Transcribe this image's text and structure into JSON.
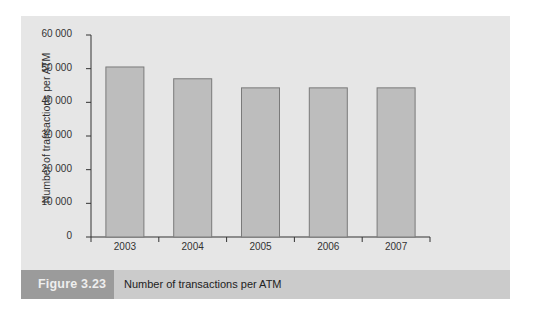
{
  "chart_data": {
    "type": "bar",
    "title": "Number of transactions per ATM",
    "figure_label": "Figure 3.23",
    "xlabel": "",
    "ylabel": "Number of transactions per ATM",
    "categories": [
      "2003",
      "2004",
      "2005",
      "2006",
      "2007"
    ],
    "values": [
      50500,
      47000,
      44300,
      44300,
      44300
    ],
    "ylim": [
      0,
      60000
    ],
    "yticks": [
      "0",
      "10 000",
      "20 000",
      "30 000",
      "40 000",
      "50 000",
      "60 000"
    ],
    "grid": false,
    "legend": null,
    "colors": {
      "bar_fill": "#bdbdbd",
      "bar_stroke": "#7a7a7a",
      "panel": "#e6e6e6",
      "caption_bar": "#cbcbcb",
      "label_box": "#9b9b9b"
    }
  },
  "caption": {
    "figure_label": "Figure 3.23",
    "title": "Number of transactions per ATM"
  }
}
